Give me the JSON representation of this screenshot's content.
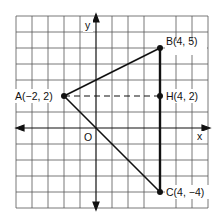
{
  "diagram": {
    "type": "coordinate-plane",
    "axes": {
      "x_label": "x",
      "y_label": "y",
      "origin_label": "O"
    },
    "grid": {
      "x_range": [
        -5,
        7
      ],
      "y_range": [
        -5,
        7
      ]
    },
    "points": [
      {
        "name": "A",
        "x": -2,
        "y": 2,
        "label": "A(−2, 2)"
      },
      {
        "name": "B",
        "x": 4,
        "y": 5,
        "label": "B(4, 5)"
      },
      {
        "name": "H",
        "x": 4,
        "y": 2,
        "label": "H(4, 2)"
      },
      {
        "name": "C",
        "x": 4,
        "y": -4,
        "label": "C(4, −4)"
      }
    ],
    "segments": [
      {
        "from": "A",
        "to": "B",
        "style": "solid"
      },
      {
        "from": "A",
        "to": "C",
        "style": "solid"
      },
      {
        "from": "B",
        "to": "C",
        "style": "solid-bold"
      },
      {
        "from": "A",
        "to": "H",
        "style": "dashed"
      }
    ]
  }
}
